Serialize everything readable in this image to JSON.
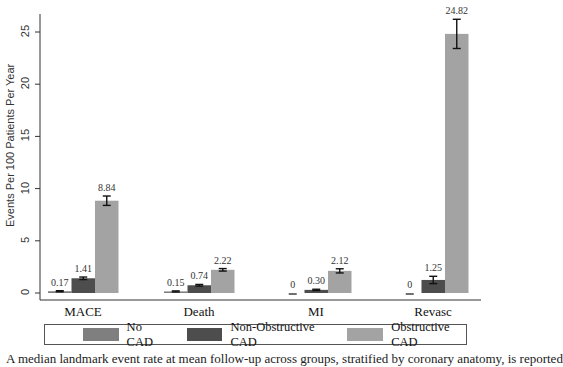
{
  "chart_data": {
    "type": "bar",
    "title": "",
    "xlabel": "",
    "ylabel": "Events Per 100 Patients Per Year",
    "ylim": [
      0,
      26.5
    ],
    "yticks": [
      0,
      5,
      10,
      15,
      20,
      25
    ],
    "grid": false,
    "legend_position": "bottom",
    "categories": [
      "MACE",
      "Death",
      "MI",
      "Revasc"
    ],
    "series": [
      {
        "name": "No CAD",
        "color": "#7f7f7f",
        "values": [
          0.17,
          0.15,
          0,
          0
        ],
        "labels": [
          "0.17",
          "0.15",
          "0",
          "0"
        ],
        "errors": [
          0.05,
          0.05,
          0.03,
          0.03
        ]
      },
      {
        "name": "Non-Obstructive CAD",
        "color": "#4d4d4d",
        "values": [
          1.41,
          0.74,
          0.3,
          1.25
        ],
        "labels": [
          "1.41",
          "0.74",
          "0.30",
          "1.25"
        ],
        "errors": [
          0.12,
          0.08,
          0.06,
          0.35
        ]
      },
      {
        "name": "Obstructive CAD",
        "color": "#a3a3a3",
        "values": [
          8.84,
          2.22,
          2.12,
          24.82
        ],
        "labels": [
          "8.84",
          "2.22",
          "2.12",
          "24.82"
        ],
        "errors": [
          0.45,
          0.12,
          0.2,
          1.4
        ]
      }
    ]
  },
  "legend": {
    "items": [
      {
        "label": "No CAD",
        "color": "#7f7f7f"
      },
      {
        "label": "Non-Obstructive CAD",
        "color": "#4d4d4d"
      },
      {
        "label": "Obstructive CAD",
        "color": "#a3a3a3"
      }
    ]
  },
  "caption": "A median landmark event rate at mean follow-up across groups, stratified by coronary anatomy, is reported"
}
